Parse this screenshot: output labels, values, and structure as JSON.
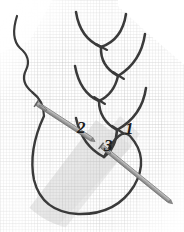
{
  "figure": {
    "kind": "embroidery-stitch-diagram",
    "technique": "feather stitch",
    "background_color": "#ffffff",
    "fabric_color": "#cfcfcf",
    "thread_color": "#3a3a3a",
    "needle_color": "#9a9a9a",
    "needle_outline_color": "#6e6e6e",
    "shadow_color": "#c8c8c8",
    "width": 184,
    "height": 232
  },
  "steps": [
    {
      "id": "1",
      "label": "1",
      "x": 125,
      "y": 120,
      "meaning": "needle exit point at base of last chevron stitch"
    },
    {
      "id": "2",
      "label": "2",
      "x": 77,
      "y": 119,
      "meaning": "needle insertion point to the left of the line"
    },
    {
      "id": "3",
      "label": "3",
      "x": 104,
      "y": 137,
      "meaning": "needle re-emergence point below, over the working loop"
    }
  ],
  "elements": {
    "thread_tail": {
      "name": "thread-tail",
      "description": "wavy loose thread end entering from top left"
    },
    "working_loop": {
      "name": "working-thread-loop",
      "description": "large U shaped loop of slack thread held below the stitch line"
    },
    "stitch_chain": {
      "name": "feather-stitch-chain",
      "count": 5,
      "description": "chain of alternating V shaped chevron stitches running down the centre"
    },
    "needles": [
      {
        "name": "needle-upper-left",
        "from": [
          36,
          104
        ],
        "to": [
          92,
          140
        ],
        "points_to_step": "2"
      },
      {
        "name": "needle-lower-right",
        "from": [
          101,
          146
        ],
        "to": [
          172,
          204
        ],
        "points_to_step": "3"
      }
    ],
    "fabric_grid": {
      "name": "fabric-weave-grid",
      "description": "fine square graph like fabric weave texture"
    }
  }
}
